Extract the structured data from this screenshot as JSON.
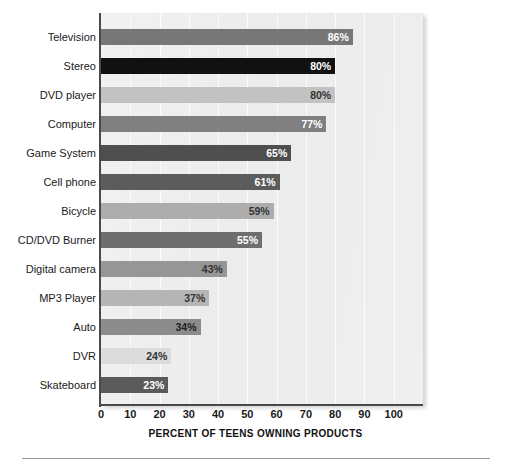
{
  "chart_data": {
    "type": "bar",
    "orientation": "horizontal",
    "title": "",
    "xlabel": "PERCENT OF TEENS OWNING PRODUCTS",
    "ylabel": "",
    "xlim": [
      0,
      110
    ],
    "xticks": [
      0,
      10,
      20,
      30,
      40,
      50,
      60,
      70,
      80,
      90,
      100
    ],
    "xtick_labels": [
      "0",
      "10",
      "20",
      "30",
      "40",
      "50",
      "60",
      "70",
      "80",
      "90",
      "100"
    ],
    "grid": "vertical",
    "legend": "none",
    "value_suffix": "%",
    "categories": [
      "Television",
      "Stereo",
      "DVD player",
      "Computer",
      "Game System",
      "Cell phone",
      "Bicycle",
      "CD/DVD Burner",
      "Digital camera",
      "MP3 Player",
      "Auto",
      "DVR",
      "Skateboard"
    ],
    "values": [
      86,
      80,
      80,
      77,
      65,
      61,
      59,
      55,
      43,
      37,
      34,
      24,
      23
    ],
    "value_labels": [
      "86%",
      "80%",
      "80%",
      "77%",
      "65%",
      "61%",
      "59%",
      "55%",
      "43%",
      "37%",
      "34%",
      "24%",
      "23%"
    ],
    "bar_colors": [
      "#777777",
      "#111111",
      "#c2c2c2",
      "#808080",
      "#4f4f4f",
      "#5c5c5c",
      "#adadad",
      "#6e6e6e",
      "#969696",
      "#b5b5b5",
      "#8c8c8c",
      "#dcdcdc",
      "#5a5a5a"
    ],
    "value_label_colors": [
      "#ffffff",
      "#ffffff",
      "#333333",
      "#ffffff",
      "#ffffff",
      "#ffffff",
      "#333333",
      "#ffffff",
      "#333333",
      "#333333",
      "#222222",
      "#333333",
      "#ffffff"
    ],
    "plot_background": "#eeeeee",
    "axis_color": "#4a4a4a"
  }
}
